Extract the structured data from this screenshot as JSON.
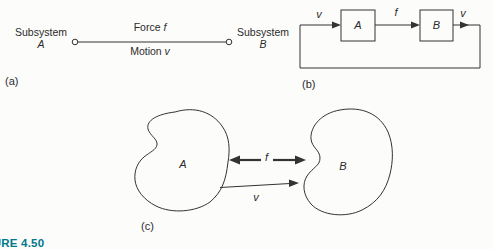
{
  "figure": {
    "caption": "FIGURE 4.50"
  },
  "colors": {
    "line": "#333333",
    "caption_teal": "#00778b",
    "background": "#fcfcfb"
  },
  "panel_a": {
    "tag": "(a)",
    "left_subsystem": {
      "label": "Subsystem",
      "name": "A"
    },
    "right_subsystem": {
      "label": "Subsystem",
      "name": "B"
    },
    "force_label": {
      "text": "Force",
      "var": "f"
    },
    "motion_label": {
      "text": "Motion",
      "var": "v"
    }
  },
  "panel_b": {
    "tag": "(b)",
    "block_a": "A",
    "block_b": "B",
    "input_signal": "v",
    "coupling_signal": "f",
    "output_signal": "v"
  },
  "panel_c": {
    "tag": "(c)",
    "subsystem_a": "A",
    "subsystem_b": "B",
    "force_var": "f",
    "velocity_var": "v"
  }
}
